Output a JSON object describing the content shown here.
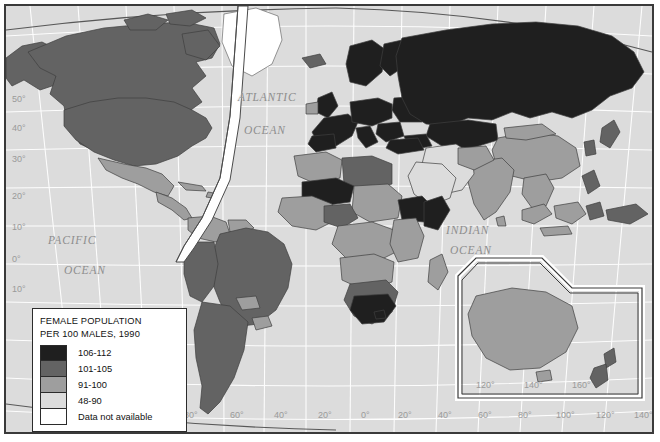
{
  "map": {
    "title_caption": "FEMALE POPULATION PER 100 MALES, 1990",
    "ocean_labels": {
      "pacific_line1": "PACIFIC",
      "pacific_line2": "OCEAN",
      "atlantic_line1": "ATLANTIC",
      "atlantic_line2": "OCEAN",
      "indian_line1": "INDIAN",
      "indian_line2": "OCEAN"
    },
    "latitude_labels": [
      "50°",
      "40°",
      "30°",
      "20°",
      "10°",
      "0°",
      "10°"
    ],
    "longitude_labels_left": [
      "80°",
      "60°",
      "40°",
      "20°"
    ],
    "longitude_labels_right": [
      "0°",
      "20°",
      "40°",
      "60°",
      "80°",
      "100°",
      "120°",
      "140°"
    ],
    "inset_longitude_labels": [
      "120°",
      "140°",
      "160°"
    ]
  },
  "legend": {
    "title_line1": "FEMALE POPULATION",
    "title_line2": "PER 100 MALES, 1990",
    "classes": [
      {
        "label": "106-112",
        "color": "#1f1f1f"
      },
      {
        "label": "101-105",
        "color": "#636363"
      },
      {
        "label": "91-100",
        "color": "#9e9e9e"
      },
      {
        "label": "48-90",
        "color": "#dcdcdc"
      },
      {
        "label": "Data not available",
        "color": "#ffffff"
      }
    ]
  },
  "colors": {
    "ocean": "#dcdcdc",
    "graticule": "#ffffff",
    "frame": "#3a3a3a",
    "border_line": "#4a4a4a",
    "label_gray": "#8e8e8e"
  }
}
